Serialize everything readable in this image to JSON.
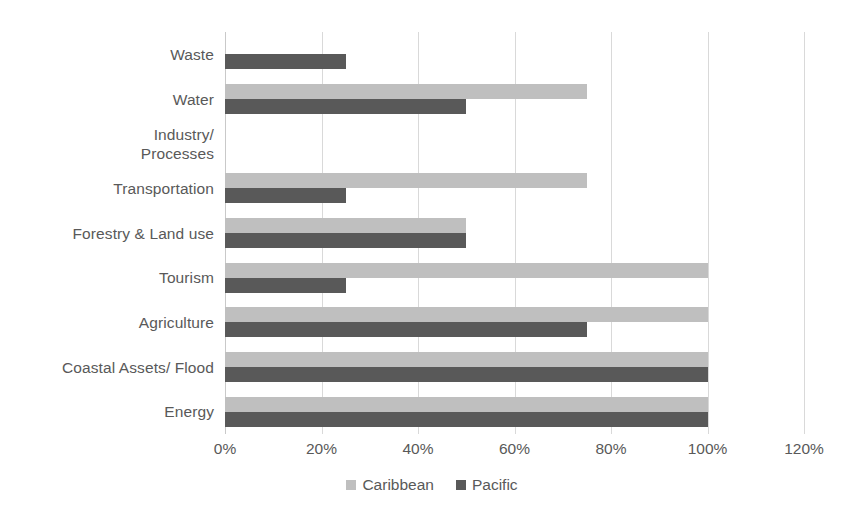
{
  "chart_data": {
    "type": "bar",
    "orientation": "horizontal",
    "title": "",
    "xlabel": "",
    "ylabel": "",
    "xlim": [
      0,
      120
    ],
    "xticks": [
      "0%",
      "20%",
      "40%",
      "60%",
      "80%",
      "100%",
      "120%"
    ],
    "xtick_values": [
      0,
      20,
      40,
      60,
      80,
      100,
      120
    ],
    "grid": "vertical",
    "legend_position": "bottom-center",
    "categories": [
      "Waste",
      "Water",
      "Industry/ Processes",
      "Transportation",
      "Forestry & Land use",
      "Tourism",
      "Agriculture",
      "Coastal Assets/ Flood",
      "Energy"
    ],
    "category_lines": [
      [
        "Waste"
      ],
      [
        "Water"
      ],
      [
        "Industry/",
        "Processes"
      ],
      [
        "Transportation"
      ],
      [
        "Forestry & Land use"
      ],
      [
        "Tourism"
      ],
      [
        "Agriculture"
      ],
      [
        "Coastal Assets/ Flood"
      ],
      [
        "Energy"
      ]
    ],
    "series": [
      {
        "name": "Caribbean",
        "color": "#bfbfbf",
        "values": [
          0,
          75,
          0,
          75,
          50,
          100,
          100,
          100,
          100
        ]
      },
      {
        "name": "Pacific",
        "color": "#595959",
        "values": [
          25,
          50,
          0,
          25,
          50,
          25,
          75,
          100,
          100
        ]
      }
    ]
  },
  "legend": {
    "items": [
      {
        "label": "Caribbean",
        "color": "#bfbfbf"
      },
      {
        "label": "Pacific",
        "color": "#595959"
      }
    ]
  },
  "colors": {
    "caribbean": "#bfbfbf",
    "pacific": "#595959",
    "gridline": "#d9d9d9",
    "text": "#595959",
    "background": "#ffffff"
  }
}
